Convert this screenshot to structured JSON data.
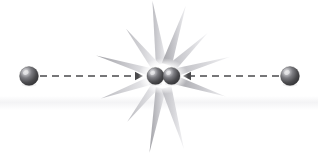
{
  "figure": {
    "width": 318,
    "height": 155,
    "background_color": "#ffffff",
    "alt_text": "Two spheres move toward each other along dashed arrows and collide at the center, producing a gray starburst flash around two touching spheres."
  },
  "colors": {
    "background": "#ffffff",
    "faint_band": "#f4f4f6",
    "sphere_dark": "#3d3d3f",
    "sphere_mid": "#6e6e72",
    "sphere_highlight": "#e8e8ea",
    "sphere_rim": "#2a2a2c",
    "arrow": "#4a4a4c",
    "spike_light": "#f2f2f4",
    "spike_mid": "#c9c9cd",
    "spike_dark": "#9b9b9f",
    "halo": "#ffffff"
  },
  "particles": [
    {
      "id": "left-particle",
      "label": "left incoming particle",
      "cx": 29,
      "cy": 76,
      "r": 9.5,
      "highlight_dx": -3.2,
      "highlight_dy": -3.4
    },
    {
      "id": "right-particle",
      "label": "right incoming particle",
      "cx": 290,
      "cy": 76,
      "r": 9.5,
      "highlight_dx": -3.0,
      "highlight_dy": -3.4
    },
    {
      "id": "collision-particle-left",
      "label": "collided particle left",
      "cx": 155.5,
      "cy": 76,
      "r": 8.6,
      "highlight_dx": -2.9,
      "highlight_dy": -3.1
    },
    {
      "id": "collision-particle-right",
      "label": "collided particle right",
      "cx": 171.5,
      "cy": 76,
      "r": 8.6,
      "highlight_dx": -2.9,
      "highlight_dy": -3.1
    }
  ],
  "arrows": [
    {
      "id": "left-arrow",
      "label": "leftward-moving particle direction arrow pointing right",
      "direction": "right",
      "y": 76,
      "x_start": 40,
      "x_end": 143,
      "dash_pattern": "7 5",
      "stroke_width": 1.5,
      "head_length": 8,
      "head_half_width": 4.2
    },
    {
      "id": "right-arrow",
      "label": "rightward-moving particle direction arrow pointing left",
      "direction": "left",
      "y": 76,
      "x_start": 279,
      "x_end": 183,
      "dash_pattern": "7 5",
      "stroke_width": 1.5,
      "head_length": 8,
      "head_half_width": 4.2
    }
  ],
  "starburst": {
    "id": "collision-flash",
    "label": "collision flash starburst",
    "cx": 163,
    "cy": 76,
    "halo_rx": 25,
    "halo_ry": 18,
    "inner_radius": 12,
    "spikes": [
      {
        "angle": -98,
        "length": 76,
        "half_width": 5.5,
        "shade": "spike_mid"
      },
      {
        "angle": -72,
        "length": 74,
        "half_width": 5.2,
        "shade": "spike_dark"
      },
      {
        "angle": -128,
        "length": 60,
        "half_width": 4.6,
        "shade": "spike_mid"
      },
      {
        "angle": -44,
        "length": 62,
        "half_width": 4.6,
        "shade": "spike_mid"
      },
      {
        "angle": -163,
        "length": 70,
        "half_width": 4.2,
        "shade": "spike_dark"
      },
      {
        "angle": -16,
        "length": 70,
        "half_width": 4.2,
        "shade": "spike_mid"
      },
      {
        "angle": 160,
        "length": 66,
        "half_width": 4.4,
        "shade": "spike_mid"
      },
      {
        "angle": 18,
        "length": 66,
        "half_width": 4.4,
        "shade": "spike_dark"
      },
      {
        "angle": 128,
        "length": 58,
        "half_width": 4.2,
        "shade": "spike_mid"
      },
      {
        "angle": 100,
        "length": 78,
        "half_width": 5.2,
        "shade": "spike_dark"
      },
      {
        "angle": 74,
        "length": 76,
        "half_width": 5.2,
        "shade": "spike_mid"
      }
    ]
  }
}
